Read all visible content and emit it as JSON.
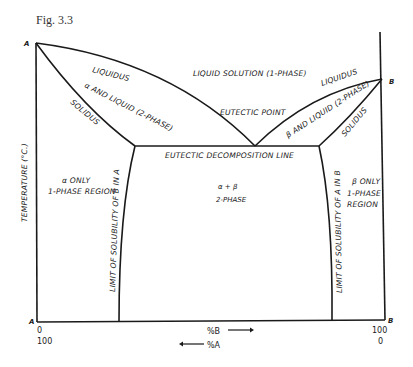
{
  "figure": {
    "title": "Fig. 3.3"
  },
  "diagram": {
    "type": "binary eutectic phase diagram",
    "y_axis_label": "TEMPERATURE (°C.)",
    "corners": {
      "top_left": "A",
      "top_right": "B",
      "bottom_left": "A",
      "bottom_right": "B"
    },
    "x_axis": {
      "left_top": "0",
      "left_bottom": "100",
      "right_top": "100",
      "right_bottom": "0",
      "label_b": "%B",
      "label_a": "%A"
    },
    "labels": {
      "liquidus_left": "LIQUIDUS",
      "alpha_liquid": "α AND LIQUID (2-PHASE)",
      "solidus_left": "SOLIDUS",
      "liquid_solution": "LIQUID SOLUTION (1-PHASE)",
      "eutectic_point": "EUTECTIC POINT",
      "liquidus_right": "LIQUIDUS",
      "beta_liquid": "β AND LIQUID (2-PHASE)",
      "solidus_right": "SOLIDUS",
      "eutectic_line": "EUTECTIC DECOMPOSITION LINE",
      "alpha_only_1": "α ONLY",
      "alpha_only_2": "1-PHASE REGION",
      "two_phase_1": "α + β",
      "two_phase_2": "2-PHASE",
      "beta_only_1": "β ONLY",
      "beta_only_2": "1-PHASE",
      "beta_only_3": "REGION",
      "solubility_b_in_a": "LIMIT OF SOLUBILITY OF B IN A",
      "solubility_a_in_b": "LIMIT OF SOLUBILITY OF A IN B"
    }
  }
}
